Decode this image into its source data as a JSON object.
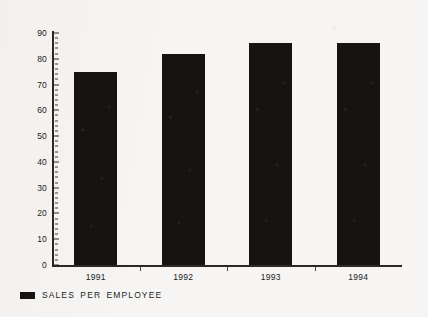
{
  "chart_data": {
    "type": "bar",
    "title": "",
    "subtitle": "",
    "xlabel": "",
    "ylabel": "",
    "categories": [
      "1991",
      "1992",
      "1993",
      "1994"
    ],
    "values": [
      75,
      82,
      86,
      86
    ],
    "series": [
      {
        "name": "SALES PER EMPLOYEE",
        "values": [
          75,
          82,
          86,
          86
        ],
        "color": "#161413"
      }
    ],
    "ylim": [
      0,
      90
    ],
    "ytick_labels": [
      "0",
      "10",
      "20",
      "30",
      "40",
      "50",
      "60",
      "70",
      "80",
      "90"
    ],
    "ytick_values": [
      0,
      10,
      20,
      30,
      40,
      50,
      60,
      70,
      80,
      90
    ],
    "minor_tick_step": 2,
    "grid": false,
    "legend": {
      "position": "bottom-left",
      "entries": [
        {
          "label": "SALES PER EMPLOYEE",
          "color": "#161413"
        }
      ]
    },
    "annotations": []
  },
  "colors": {
    "bar": "#161413",
    "axis": "#2a2724",
    "text": "#201d1c",
    "background": "#f6f5f3"
  }
}
